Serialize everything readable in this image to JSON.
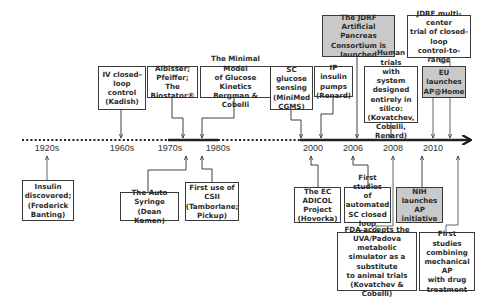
{
  "timeline": {
    "labels": [
      {
        "text": "1920s",
        "x": 47
      },
      {
        "text": "1960s",
        "x": 122
      },
      {
        "text": "1970s",
        "x": 170
      },
      {
        "text": "1980s",
        "x": 218
      },
      {
        "text": "2000",
        "x": 313
      },
      {
        "text": "2006",
        "x": 353
      },
      {
        "text": "2008",
        "x": 393
      },
      {
        "text": "2010",
        "x": 433
      }
    ]
  },
  "events_above": [
    {
      "id": "iv",
      "text": "IV closed-\nloop\ncontrol\n(Kadish)",
      "highlight": false
    },
    {
      "id": "albisser",
      "text": "Albisser;\nPfeiffer;\nThe Biostator®",
      "highlight": false
    },
    {
      "id": "minimal",
      "text": "The Minimal Model\nof Glucose Kinetics\nBergman & Cobelli",
      "highlight": false
    },
    {
      "id": "sc",
      "text": "SC glucose\nsensing\n(MiniMed\nCGMS)",
      "highlight": false
    },
    {
      "id": "ip",
      "text": "IP insulin\npumps\n(Renard)",
      "highlight": false
    },
    {
      "id": "jdrf",
      "text": "The JDRF Artificial\nPancreas\nConsortium is\nlaunched",
      "highlight": true
    },
    {
      "id": "human",
      "text": "Human trials\nwith system\ndesigned\nentirely in silico:\n(Kovatchev,\nCobelli, Renard)",
      "highlight": false
    },
    {
      "id": "jdrfmulti",
      "text": "JDRF multi-center\ntrial of closed-loop\ncontrol-to-range",
      "highlight": false
    },
    {
      "id": "eu",
      "text": "EU launches\nAP@Home",
      "highlight": true
    }
  ],
  "events_below": [
    {
      "id": "insulin",
      "text": "Insulin\ndiscovered;\n(Frederick\nBanting)",
      "highlight": false
    },
    {
      "id": "autosyringe",
      "text": "The Auto Syringe\n(Dean Kamen)",
      "highlight": false
    },
    {
      "id": "csii",
      "text": "First use of CSII\n(Tamborlane;\nPickup)",
      "highlight": false
    },
    {
      "id": "adicol",
      "text": "The EC\nADICOL\nProject\n(Hovorka)",
      "highlight": false
    },
    {
      "id": "steil",
      "text": "First studies\nof automated\nSC closed\nloop (Steil)",
      "highlight": false
    },
    {
      "id": "nih",
      "text": "NIH launches\nAP initiative",
      "highlight": true
    },
    {
      "id": "fda",
      "text": "FDA accepts the\nUVA/Padova metabolic\nsimulator as a\nsubstitute\nto animal trials\n(Kovatchev & Cobelli)",
      "highlight": false
    },
    {
      "id": "drug",
      "text": "First studies\ncombining\nmechanical AP\nwith drug\ntreatment",
      "highlight": false
    }
  ],
  "colors": {
    "line": "#2a2a2a",
    "highlight_fill": "#c9c9c9",
    "connector_light": "#6a6a6a"
  }
}
